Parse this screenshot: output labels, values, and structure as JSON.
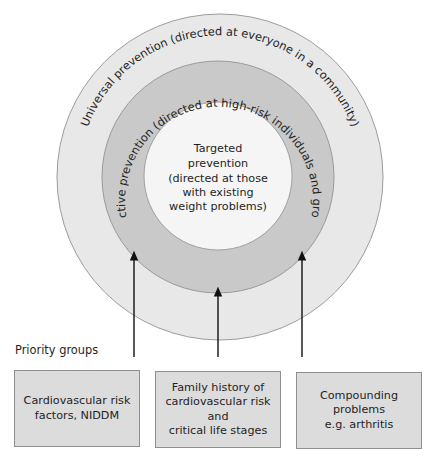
{
  "diagram": {
    "rings": {
      "universal": {
        "label": "Universal prevention (directed at everyone in a community)",
        "color": "#e8e8e8",
        "border": "#9c9c9c"
      },
      "selective": {
        "label": "Selective prevention (directed at high-risk individuals and groups)",
        "color": "#c9c9c9",
        "border": "#9a9a9a"
      },
      "targeted": {
        "lines": [
          "Targeted",
          "prevention",
          "(directed at those",
          "with existing",
          "weight problems)"
        ],
        "color": "#f5f5f5",
        "border": "#a0a0a0"
      }
    },
    "priority_label": "Priority groups",
    "priority_groups": [
      {
        "label": "Cardiovascular risk\nfactors, NIDDM",
        "arrow_target": "targeted"
      },
      {
        "label": "Family history of\ncardiovascular risk and\ncritical life stages",
        "arrow_target": "selective"
      },
      {
        "label": "Compounding\nproblems\ne.g. arthritis",
        "arrow_target": "targeted"
      }
    ],
    "box_color": "#dcdcdc",
    "arrow_color": "#111111"
  }
}
